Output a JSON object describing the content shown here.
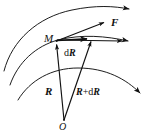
{
  "figure": {
    "type": "vector-diagram",
    "background_color": "#ffffff",
    "stroke_color": "#111111",
    "labels": {
      "point_m": "M",
      "force": "F",
      "displacement_prefix": "d",
      "displacement_vector": "R",
      "position_vector": "R",
      "new_position_vector_lead": "R",
      "new_position_plus": "+",
      "new_position_d": "d",
      "new_position_tail": "R",
      "origin": "O"
    },
    "geometry": {
      "origin_point": {
        "x": 64,
        "y": 120
      },
      "point_m": {
        "x": 56,
        "y": 41
      },
      "point_m_prime": {
        "x": 92,
        "y": 38
      },
      "force_tip": {
        "x": 107,
        "y": 22
      },
      "tangent_tip": {
        "x": 126,
        "y": 41
      }
    },
    "curves": [
      {
        "name": "trajectory-outer",
        "has_arrowhead": true
      },
      {
        "name": "trajectory-through-m",
        "has_arrowhead": true
      },
      {
        "name": "trajectory-lower",
        "has_arrowhead": true
      }
    ],
    "vectors": [
      {
        "name": "position-vector-R",
        "from": "O",
        "to": "M",
        "label": "R"
      },
      {
        "name": "position-vector-R-plus-dR",
        "from": "O",
        "to": "M'",
        "label": "R+dR"
      },
      {
        "name": "displacement-vector-dR",
        "from": "M",
        "to": "M'",
        "label": "dR"
      },
      {
        "name": "force-vector-F",
        "from": "M",
        "to": "F tip",
        "label": "F"
      },
      {
        "name": "tangent-vector",
        "from": "M",
        "to": "tangent tip",
        "label": ""
      }
    ]
  }
}
